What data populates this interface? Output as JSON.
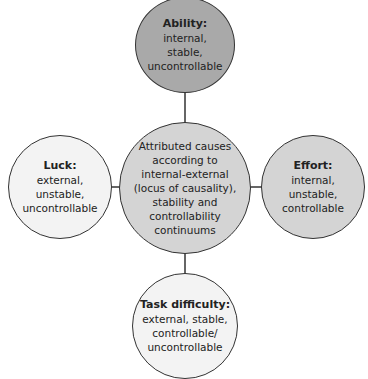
{
  "colors": {
    "dark": "#a9a9a9",
    "mid": "#d4d4d4",
    "light": "#f3f3f3",
    "line": "#333333"
  },
  "nodes": {
    "center": {
      "lines": [
        "Attributed causes",
        "according to",
        "internal-external",
        "(locus of causality),",
        "stability and",
        "controllability",
        "continuums"
      ]
    },
    "ability": {
      "title": "Ability:",
      "lines": [
        "internal,",
        "stable,",
        "uncontrollable"
      ]
    },
    "luck": {
      "title": "Luck:",
      "lines": [
        "external,",
        "unstable,",
        "uncontrollable"
      ]
    },
    "effort": {
      "title": "Effort:",
      "lines": [
        "internal,",
        "unstable,",
        "controllable"
      ]
    },
    "task": {
      "title": "Task difficulty:",
      "lines": [
        "external, stable,",
        "controllable/",
        "uncontrollable"
      ]
    }
  }
}
